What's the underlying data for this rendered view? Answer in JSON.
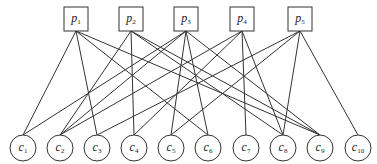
{
  "diagram": {
    "type": "bipartite-graph",
    "top_nodes": [
      {
        "id": "p1",
        "base": "p",
        "sub": "1",
        "x": 76
      },
      {
        "id": "p2",
        "base": "p",
        "sub": "2",
        "x": 131
      },
      {
        "id": "p3",
        "base": "p",
        "sub": "3",
        "x": 186
      },
      {
        "id": "p4",
        "base": "p",
        "sub": "4",
        "x": 242
      },
      {
        "id": "p5",
        "base": "p",
        "sub": "5",
        "x": 300
      }
    ],
    "bottom_nodes": [
      {
        "id": "c1",
        "base": "c",
        "sub": "1",
        "x": 23
      },
      {
        "id": "c2",
        "base": "c",
        "sub": "2",
        "x": 60
      },
      {
        "id": "c3",
        "base": "c",
        "sub": "3",
        "x": 97
      },
      {
        "id": "c4",
        "base": "c",
        "sub": "4",
        "x": 134
      },
      {
        "id": "c5",
        "base": "c",
        "sub": "5",
        "x": 171
      },
      {
        "id": "c6",
        "base": "c",
        "sub": "6",
        "x": 208
      },
      {
        "id": "c7",
        "base": "c",
        "sub": "7",
        "x": 246
      },
      {
        "id": "c8",
        "base": "c",
        "sub": "8",
        "x": 283
      },
      {
        "id": "c9",
        "base": "c",
        "sub": "9",
        "x": 320
      },
      {
        "id": "c10",
        "base": "c",
        "sub": "10",
        "x": 358
      }
    ],
    "edges": [
      [
        "p1",
        "c1"
      ],
      [
        "p1",
        "c3"
      ],
      [
        "p1",
        "c6"
      ],
      [
        "p1",
        "c9"
      ],
      [
        "p2",
        "c2"
      ],
      [
        "p2",
        "c4"
      ],
      [
        "p2",
        "c8"
      ],
      [
        "p2",
        "c9"
      ],
      [
        "p3",
        "c1"
      ],
      [
        "p3",
        "c2"
      ],
      [
        "p3",
        "c5"
      ],
      [
        "p3",
        "c6"
      ],
      [
        "p3",
        "c9"
      ],
      [
        "p4",
        "c2"
      ],
      [
        "p4",
        "c4"
      ],
      [
        "p4",
        "c7"
      ],
      [
        "p4",
        "c8"
      ],
      [
        "p5",
        "c3"
      ],
      [
        "p5",
        "c5"
      ],
      [
        "p5",
        "c8"
      ],
      [
        "p5",
        "c10"
      ]
    ],
    "colors": {
      "stroke": "#333333",
      "fill": "#ffffff",
      "text": "#222222"
    }
  }
}
